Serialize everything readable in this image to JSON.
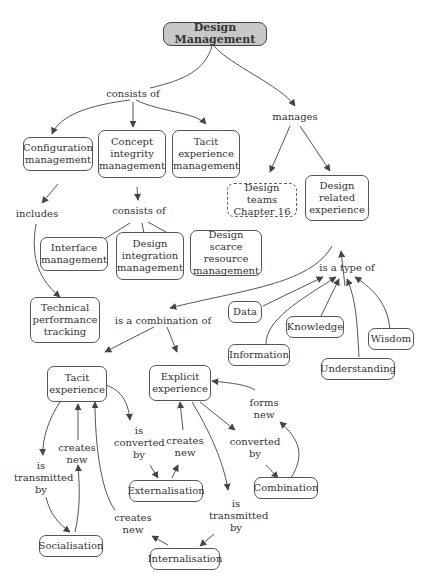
{
  "nodes": {
    "root": "Design Management",
    "configuration": "Configuration management",
    "concept_integrity": "Concept integrity management",
    "tacit_exp_mgmt": "Tacit experience management",
    "design_teams": "Design teams Chapter 16",
    "design_related": "Design related experience",
    "interface": "Interface management",
    "design_integration": "Design integration management",
    "design_scarce": "Design scarce resource management",
    "technical": "Technical performance tracking",
    "data": "Data",
    "knowledge": "Knowledge",
    "wisdom": "Wisdom",
    "information": "Information",
    "understanding": "Understanding",
    "tacit": "Tacit experience",
    "explicit": "Explicit experience",
    "externalisation": "Externalisation",
    "combination": "Combination",
    "socialisation": "Socialisation",
    "internalisation": "Internalisation"
  },
  "links": {
    "consists_of_1": "consists of",
    "manages": "manages",
    "includes": "includes",
    "consists_of_2": "consists of",
    "is_a_type_of": "is a type of",
    "is_a_combination_of": "is a combination of",
    "is_converted_by": "is converted by",
    "creates_new_1": "creates new",
    "creates_new_2": "creates new",
    "forms_new": "forms new",
    "converted_by": "converted by",
    "is_transmitted_by_1": "is transmitted by",
    "is_transmitted_by_2": "is transmitted by",
    "creates_new_3": "creates new"
  },
  "colors": {
    "root_fill": "#c8c8c8",
    "border": "#555555",
    "edge": "#444444"
  }
}
